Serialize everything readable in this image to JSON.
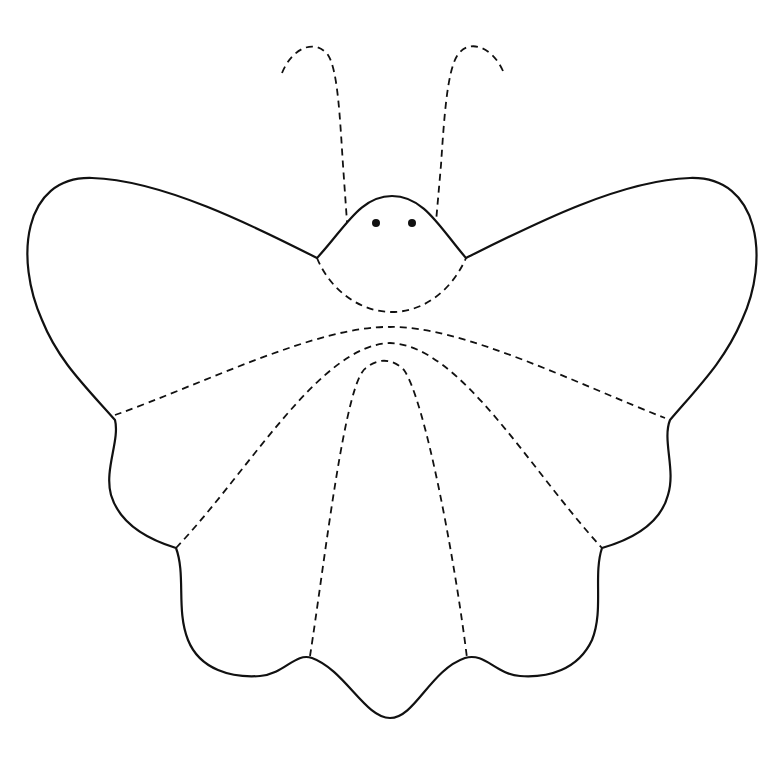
{
  "figure": {
    "background": "#ffffff",
    "stroke_color": "#111111",
    "parts": {
      "outline": "solid body and wing outline",
      "antennae": "dashed curved antennae (2)",
      "head_fold": "dashed arc below head",
      "wing_folds": "dashed fold lines radiating across wings",
      "eyes": 2
    }
  }
}
